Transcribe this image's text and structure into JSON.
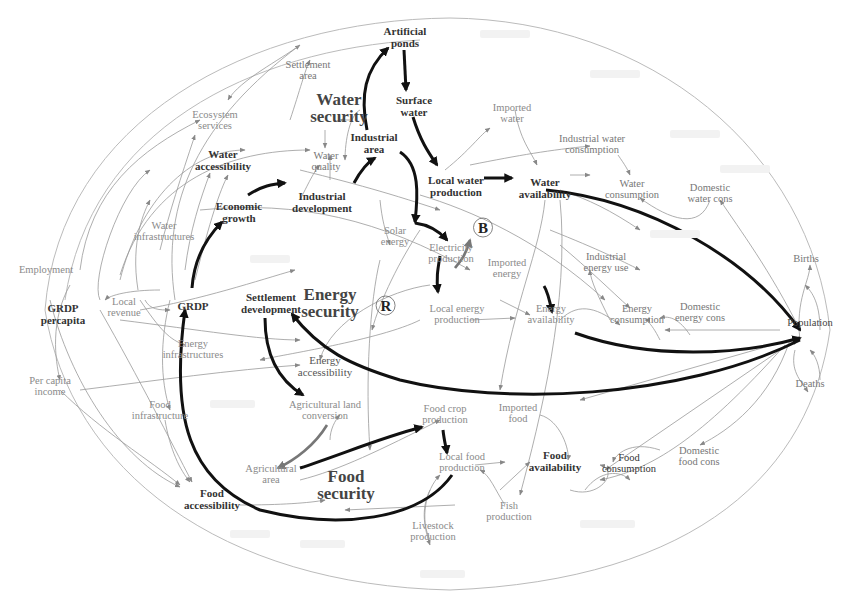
{
  "diagram": {
    "type": "causal-loop-diagram",
    "security_labels": {
      "water": "Water\nsecurity",
      "energy": "Energy\nsecurity",
      "food": "Food\nsecurity"
    },
    "loops": {
      "balancing": "B",
      "reinforcing": "R"
    },
    "nodes": {
      "artificial_ponds": "Artificial\nponds",
      "settlement_area": "Settlement\narea",
      "surface_water": "Surface\nwater",
      "imported_water": "Imported\nwater",
      "ecosystem_services": "Ecosystem\nservices",
      "water_accessibility": "Water\naccessibility",
      "water_quality": "Water\nquality",
      "industrial_area": "Industrial\narea",
      "industrial_water_consumption": "Industrial water\nconsumption",
      "local_water_production": "Local water\nproduction",
      "water_availability": "Water\navailability",
      "water_consumption": "Water\nconsumption",
      "domestic_water_cons": "Domestic\nwater cons",
      "economic_growth": "Economic\ngrowth",
      "industrial_development": "Industrial\ndevelopment",
      "water_infrastructures": "Water\ninfrastructures",
      "solar_energy": "Solar\nenergy",
      "electricity_production": "Electricity\nproduction",
      "imported_energy": "Imported\nenergy",
      "industrial_energy_use": "Industrial\nenergy use",
      "employment": "Employment",
      "grdp_percapita": "GRDP\npercapita",
      "local_revenue": "Local\nrevenue",
      "grdp": "GRDP",
      "settlement_development": "Settlement\ndevelopment",
      "local_energy_production": "Local energy\nproduction",
      "energy_availability": "Energy\navailability",
      "energy_consumption": "Energy\nconsumption",
      "domestic_energy_cons": "Domestic\nenergy cons",
      "births": "Births",
      "population": "Population",
      "deaths": "Deaths",
      "energy_infrastructures": "Energy\ninfrastructures",
      "energy_accessibility": "Energy\naccessibility",
      "per_capita_income": "Per capita\nincome",
      "agricultural_land_conversion": "Agricultural land\nconversion",
      "food_infrastructure": "Food\ninfrastructure",
      "food_crop_production": "Food crop\nproduction",
      "imported_food": "Imported\nfood",
      "local_food_production": "Local food\nproduction",
      "food_availability": "Food\navailability",
      "food_consumption": "Food\nconsumption",
      "domestic_food_cons": "Domestic\nfood cons",
      "agricultural_area": "Agricultural\narea",
      "food_accessibility": "Food\naccessibility",
      "livestock_production": "Livestock\nproduction",
      "fish_production": "Fish\nproduction"
    }
  }
}
